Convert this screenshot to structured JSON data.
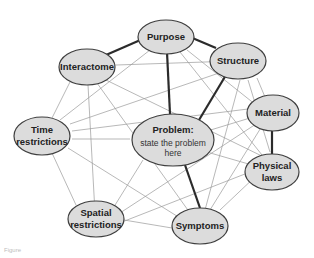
{
  "diagram": {
    "type": "network",
    "colors": {
      "node_fill": "#dcdcdc",
      "node_stroke": "#3f3f3f",
      "thin_edge": "#9a9a9a",
      "thick_edge": "#2b2b2b",
      "background": "#ffffff"
    },
    "nodes": {
      "purpose": {
        "label": "Purpose"
      },
      "interactome": {
        "label": "Interactome"
      },
      "structure": {
        "label": "Structure"
      },
      "time": {
        "line1": "Time",
        "line2": "restrictions"
      },
      "material": {
        "label": "Material"
      },
      "problem": {
        "title": "Problem:",
        "line1": "state the problem",
        "line2": "here"
      },
      "physical": {
        "line1": "Physical",
        "line2": "laws"
      },
      "spatial": {
        "line1": "Spatial",
        "line2": "restrictions"
      },
      "symptoms": {
        "label": "Symptoms"
      }
    },
    "edges_thick": [
      [
        "purpose",
        "interactome"
      ],
      [
        "purpose",
        "structure"
      ],
      [
        "purpose",
        "problem"
      ],
      [
        "structure",
        "problem"
      ],
      [
        "material",
        "physical"
      ],
      [
        "problem",
        "symptoms"
      ]
    ],
    "edges_thin": [
      [
        "interactome",
        "structure"
      ],
      [
        "interactome",
        "time"
      ],
      [
        "interactome",
        "spatial"
      ],
      [
        "interactome",
        "symptoms"
      ],
      [
        "interactome",
        "physical"
      ],
      [
        "purpose",
        "time"
      ],
      [
        "purpose",
        "material"
      ],
      [
        "purpose",
        "physical"
      ],
      [
        "structure",
        "time"
      ],
      [
        "structure",
        "material"
      ],
      [
        "structure",
        "physical"
      ],
      [
        "structure",
        "symptoms"
      ],
      [
        "time",
        "problem"
      ],
      [
        "time",
        "material"
      ],
      [
        "time",
        "spatial"
      ],
      [
        "time",
        "symptoms"
      ],
      [
        "material",
        "problem"
      ],
      [
        "material",
        "spatial"
      ],
      [
        "material",
        "symptoms"
      ],
      [
        "problem",
        "spatial"
      ],
      [
        "problem",
        "physical"
      ],
      [
        "physical",
        "spatial"
      ],
      [
        "physical",
        "symptoms"
      ],
      [
        "spatial",
        "symptoms"
      ]
    ]
  },
  "caption": {
    "text": "Figure"
  }
}
